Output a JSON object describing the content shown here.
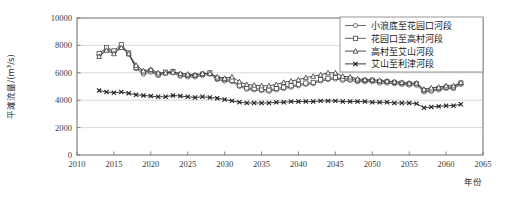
{
  "chart_data": {
    "type": "line",
    "title": "",
    "xlabel": "年份",
    "ylabel": "平滩流量/(m³/s)",
    "xlim": [
      2010,
      2065
    ],
    "ylim": [
      0,
      10000
    ],
    "xticks": [
      2010,
      2015,
      2020,
      2025,
      2030,
      2035,
      2040,
      2045,
      2050,
      2055,
      2060,
      2065
    ],
    "yticks": [
      0,
      2000,
      4000,
      6000,
      8000,
      10000
    ],
    "grid": "horizontal",
    "legend_position": "top-right",
    "x": [
      2013,
      2014,
      2015,
      2016,
      2017,
      2018,
      2019,
      2020,
      2021,
      2022,
      2023,
      2024,
      2025,
      2026,
      2027,
      2028,
      2029,
      2030,
      2031,
      2032,
      2033,
      2034,
      2035,
      2036,
      2037,
      2038,
      2039,
      2040,
      2041,
      2042,
      2043,
      2044,
      2045,
      2046,
      2047,
      2048,
      2049,
      2050,
      2051,
      2052,
      2053,
      2054,
      2055,
      2056,
      2057,
      2058,
      2059,
      2060,
      2061,
      2062
    ],
    "series": [
      {
        "name": "小浪底至花园口河段",
        "marker": "circle",
        "color": "#555555",
        "values": [
          7300,
          7750,
          7500,
          7950,
          7350,
          6300,
          5900,
          6050,
          5800,
          5950,
          6000,
          5750,
          5700,
          5700,
          5800,
          5900,
          5500,
          5400,
          5350,
          5000,
          4800,
          4750,
          4700,
          4650,
          4750,
          4850,
          4950,
          5050,
          5150,
          5200,
          5400,
          5500,
          5550,
          5450,
          5450,
          5350,
          5350,
          5350,
          5250,
          5250,
          5200,
          5150,
          5100,
          5100,
          4600,
          4650,
          4750,
          4850,
          4850,
          5150
        ]
      },
      {
        "name": "花园口至高村河段",
        "marker": "square",
        "color": "#4a4a4a",
        "values": [
          7400,
          7850,
          7600,
          8050,
          7450,
          6400,
          6050,
          6150,
          5900,
          6050,
          6100,
          5850,
          5800,
          5800,
          5900,
          6000,
          5600,
          5500,
          5450,
          5100,
          4900,
          4850,
          4800,
          4750,
          4850,
          4950,
          5050,
          5150,
          5250,
          5300,
          5500,
          5600,
          5650,
          5550,
          5550,
          5450,
          5450,
          5450,
          5350,
          5350,
          5300,
          5250,
          5200,
          5200,
          4700,
          4750,
          4850,
          4950,
          4950,
          5250
        ]
      },
      {
        "name": "高村至艾山河段",
        "marker": "triangle",
        "color": "#3a3a3a",
        "values": [
          7200,
          7650,
          7400,
          7850,
          7400,
          6550,
          6150,
          6250,
          6000,
          6000,
          6050,
          5950,
          5900,
          5850,
          5950,
          5950,
          5700,
          5600,
          5700,
          5350,
          5150,
          5100,
          5050,
          5050,
          5150,
          5300,
          5400,
          5500,
          5650,
          5750,
          5850,
          6000,
          6000,
          5750,
          5700,
          5550,
          5500,
          5500,
          5450,
          5400,
          5350,
          5300,
          5250,
          5250,
          4800,
          4900,
          4950,
          5050,
          5050,
          5300
        ]
      },
      {
        "name": "艾山至利津河段",
        "marker": "x",
        "color": "#222222",
        "values": [
          4700,
          4600,
          4550,
          4600,
          4500,
          4400,
          4350,
          4300,
          4250,
          4250,
          4350,
          4300,
          4250,
          4200,
          4250,
          4200,
          4150,
          4050,
          3950,
          3850,
          3800,
          3800,
          3800,
          3800,
          3850,
          3850,
          3900,
          3900,
          3900,
          3900,
          3950,
          3950,
          3950,
          3900,
          3900,
          3900,
          3900,
          3850,
          3850,
          3850,
          3800,
          3800,
          3800,
          3750,
          3450,
          3500,
          3550,
          3600,
          3600,
          3700
        ]
      }
    ]
  },
  "axis": {
    "y_title": "平滩流量/(m³/s)",
    "x_title": "年份"
  },
  "legend": {
    "items": [
      {
        "label": "小浪底至花园口河段",
        "marker": "circle-marker"
      },
      {
        "label": "花园口至高村河段",
        "marker": "square-marker"
      },
      {
        "label": "高村至艾山河段",
        "marker": "triangle-marker"
      },
      {
        "label": "艾山至利津河段",
        "marker": "x-marker"
      }
    ]
  },
  "colors": {
    "axis": "#6b6b6b",
    "grid": "#c8c8c8",
    "plot_background": "#ffffff",
    "legend_border": "#8a8a8a"
  }
}
